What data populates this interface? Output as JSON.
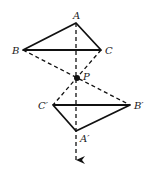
{
  "diagram": {
    "points": {
      "A": {
        "label": "A",
        "x": 76,
        "y": 23
      },
      "B": {
        "label": "B",
        "x": 23,
        "y": 50
      },
      "C": {
        "label": "C",
        "x": 101,
        "y": 50
      },
      "P": {
        "label": "P",
        "x": 77,
        "y": 78
      },
      "Cp": {
        "label": "C′",
        "x": 53,
        "y": 105
      },
      "Bp": {
        "label": "B′",
        "x": 130,
        "y": 105
      },
      "Ap": {
        "label": "A′",
        "x": 76,
        "y": 131
      }
    },
    "arrow_end": {
      "x": 76,
      "y": 162
    },
    "colors": {
      "stroke": "#111111",
      "background": "#ffffff"
    }
  }
}
